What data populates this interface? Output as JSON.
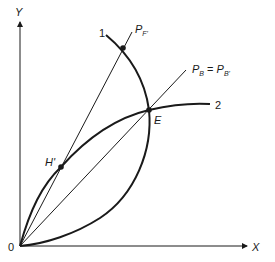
{
  "diagram": {
    "axes": {
      "x_label": "X",
      "y_label": "Y",
      "origin_label": "0"
    },
    "curves": [
      {
        "id": "curve-1",
        "label": "1"
      },
      {
        "id": "curve-2",
        "label": "2"
      }
    ],
    "rays": [
      {
        "id": "ray-pf",
        "label_main": "P",
        "label_sub": "F'"
      },
      {
        "id": "ray-pb",
        "label_main": "P",
        "label_sub": "B",
        "label_eq": " = ",
        "label_main2": "P",
        "label_sub2": "B'"
      }
    ],
    "points": [
      {
        "id": "point-e",
        "label": "E"
      },
      {
        "id": "point-h",
        "label": "H'"
      }
    ],
    "colors": {
      "ink": "#1a1a1a",
      "background": "#ffffff"
    }
  }
}
